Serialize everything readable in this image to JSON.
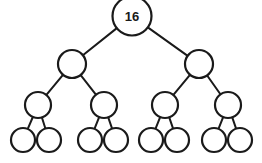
{
  "figure": {
    "background_color": "#ffffff",
    "stroke_color": "#1a1a1a",
    "node_fill_color": "#ffffff",
    "edge_stroke_width": 2,
    "node_stroke_width": 2.2
  },
  "chart_data": {
    "type": "diagram",
    "diagram_kind": "binary-tree",
    "title": "",
    "depth": 4,
    "node_count": 15,
    "leaf_count": 8,
    "labels_shown": [
      "16"
    ],
    "nodes": [
      {
        "id": "n0",
        "label": "16",
        "level": 0,
        "cx": 132,
        "cy": 16,
        "r": 19.5
      },
      {
        "id": "n1",
        "label": "",
        "level": 1,
        "cx": 72,
        "cy": 64,
        "r": 14.0
      },
      {
        "id": "n2",
        "label": "",
        "level": 1,
        "cx": 199,
        "cy": 64,
        "r": 14.0
      },
      {
        "id": "n3",
        "label": "",
        "level": 2,
        "cx": 38,
        "cy": 105,
        "r": 13.0
      },
      {
        "id": "n4",
        "label": "",
        "level": 2,
        "cx": 104,
        "cy": 105,
        "r": 13.0
      },
      {
        "id": "n5",
        "label": "",
        "level": 2,
        "cx": 165,
        "cy": 105,
        "r": 13.0
      },
      {
        "id": "n6",
        "label": "",
        "level": 2,
        "cx": 228,
        "cy": 105,
        "r": 13.0
      },
      {
        "id": "n7",
        "label": "",
        "level": 3,
        "cx": 23,
        "cy": 140,
        "r": 12.0
      },
      {
        "id": "n8",
        "label": "",
        "level": 3,
        "cx": 49,
        "cy": 140,
        "r": 12.0
      },
      {
        "id": "n9",
        "label": "",
        "level": 3,
        "cx": 90,
        "cy": 140,
        "r": 12.0
      },
      {
        "id": "n10",
        "label": "",
        "level": 3,
        "cx": 116,
        "cy": 140,
        "r": 12.0
      },
      {
        "id": "n11",
        "label": "",
        "level": 3,
        "cx": 151,
        "cy": 140,
        "r": 12.0
      },
      {
        "id": "n12",
        "label": "",
        "level": 3,
        "cx": 177,
        "cy": 140,
        "r": 12.0
      },
      {
        "id": "n13",
        "label": "",
        "level": 3,
        "cx": 214,
        "cy": 140,
        "r": 12.0
      },
      {
        "id": "n14",
        "label": "",
        "level": 3,
        "cx": 240,
        "cy": 140,
        "r": 12.0
      }
    ],
    "edges": [
      {
        "from": "n0",
        "to": "n1"
      },
      {
        "from": "n0",
        "to": "n2"
      },
      {
        "from": "n1",
        "to": "n3"
      },
      {
        "from": "n1",
        "to": "n4"
      },
      {
        "from": "n2",
        "to": "n5"
      },
      {
        "from": "n2",
        "to": "n6"
      },
      {
        "from": "n3",
        "to": "n7"
      },
      {
        "from": "n3",
        "to": "n8"
      },
      {
        "from": "n4",
        "to": "n9"
      },
      {
        "from": "n4",
        "to": "n10"
      },
      {
        "from": "n5",
        "to": "n11"
      },
      {
        "from": "n5",
        "to": "n12"
      },
      {
        "from": "n6",
        "to": "n13"
      },
      {
        "from": "n6",
        "to": "n14"
      }
    ]
  }
}
